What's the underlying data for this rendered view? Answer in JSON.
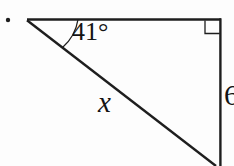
{
  "figure": {
    "angle_label": "41°",
    "hypotenuse_label": "x",
    "side_label": "6"
  },
  "colors": {
    "line": "#1e1e1e",
    "text": "#141414",
    "background": "#fdfdfd"
  }
}
